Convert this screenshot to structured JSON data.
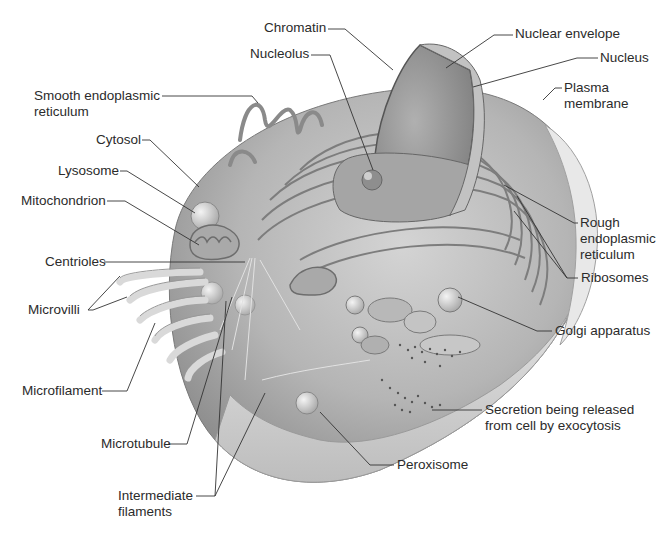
{
  "diagram": {
    "labels": {
      "chromatin": "Chromatin",
      "nucleolus": "Nucleolus",
      "nuclear_envelope": "Nuclear envelope",
      "nucleus": "Nucleus",
      "plasma_membrane": [
        "Plasma",
        "membrane"
      ],
      "smooth_er": [
        "Smooth endoplasmic",
        "reticulum"
      ],
      "cytosol": "Cytosol",
      "lysosome": "Lysosome",
      "mitochondrion": "Mitochondrion",
      "centrioles": "Centrioles",
      "microvilli": "Microvilli",
      "rough_er": [
        "Rough",
        "endoplasmic",
        "reticulum"
      ],
      "ribosomes": "Ribosomes",
      "golgi": "Golgi apparatus",
      "microfilament": "Microfilament",
      "secretion": [
        "Secretion being released",
        "from cell by exocytosis"
      ],
      "microtubule": "Microtubule",
      "peroxisome": "Peroxisome",
      "intermediate_filaments": [
        "Intermediate",
        "filaments"
      ]
    },
    "colors": {
      "background": "#ffffff",
      "cell_body": "#bdbdbd",
      "cell_shadow": "#8a8a8a",
      "membrane_light": "#e6e6e6",
      "nucleus": "#9c9c9c",
      "leader_line": "#333333",
      "text": "#2b2b2b"
    }
  }
}
